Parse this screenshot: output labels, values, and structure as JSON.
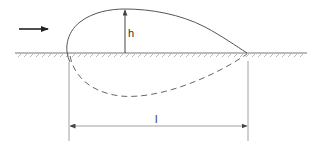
{
  "diagram": {
    "type": "airfoil-shaped profile on ground with dimensions",
    "labels": {
      "height": "h",
      "length": "l"
    },
    "elements": {
      "flow_arrow": "arrow-right-icon",
      "ground": "hatched-ground-line",
      "upper_profile": "solid-curve",
      "lower_profile": "dashed-curve",
      "height_dimension": "vertical-arrow",
      "length_dimension": "double-headed-horizontal-arrow"
    },
    "colors": {
      "stroke": "#555555",
      "ground": "#777777",
      "background": "#ffffff"
    }
  }
}
